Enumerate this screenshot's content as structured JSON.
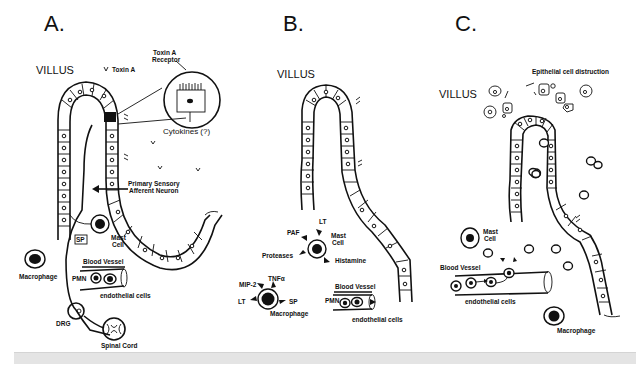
{
  "figure": {
    "panels": [
      {
        "id": "A",
        "letter": "A.",
        "villus_label": "VILLUS",
        "labels": {
          "toxin_a": "Toxin A",
          "toxin_a_receptor_line1": "Toxin A",
          "toxin_a_receptor_line2": "Receptor",
          "cytokines": "Cytokines (?)",
          "neuron_line1": "Primary Sensory",
          "neuron_line2": "Afferent Neuron",
          "sp": "SP",
          "mast_cell_line1": "Mast",
          "mast_cell_line2": "Cell",
          "macrophage": "Macrophage",
          "blood_vessel": "Blood Vessel",
          "pmn": "PMN",
          "endothelial": "endothelial cells",
          "drg": "DRG",
          "spinal_cord": "Spinal Cord"
        }
      },
      {
        "id": "B",
        "letter": "B.",
        "villus_label": "VILLUS",
        "labels": {
          "lt_top": "LT",
          "paf": "PAF",
          "mast_cell_line1": "Mast",
          "mast_cell_line2": "Cell",
          "proteases": "Proteases",
          "histamine": "Histamine",
          "mip2": "MIP-2",
          "tnfa": "TNFα",
          "lt_left": "LT",
          "sp": "SP",
          "macrophage": "Macrophage",
          "blood_vessel": "Blood Vessel",
          "pmn": "PMN",
          "endothelial": "endothelial cells"
        }
      },
      {
        "id": "C",
        "letter": "C.",
        "villus_label": "VILLUS",
        "labels": {
          "epithelial_destruction": "Epithelial cell distruction",
          "mast_cell_line1": "Mast",
          "mast_cell_line2": "Cell",
          "blood_vessel": "Blood Vessel",
          "endothelial": "endothelial cells",
          "macrophage": "Macrophage"
        }
      }
    ],
    "colors": {
      "ink": "#111111",
      "background": "#ffffff",
      "footer_strip": "#e4e4e4"
    }
  }
}
